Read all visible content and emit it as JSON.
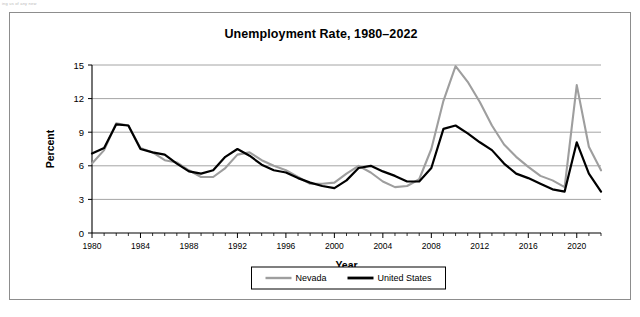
{
  "page": {
    "scan_fragment": "ing us of any new"
  },
  "figure": {
    "title": "Unemployment Rate, 1980–2022"
  },
  "chart_data": {
    "type": "line",
    "title": "Unemployment Rate, 1980–2022",
    "xlabel": "Year",
    "ylabel": "Percent",
    "xlim": [
      1980,
      2022
    ],
    "ylim": [
      0,
      15
    ],
    "yticks": [
      0,
      3,
      6,
      9,
      12,
      15
    ],
    "xticks": [
      1980,
      1984,
      1988,
      1992,
      1996,
      2000,
      2004,
      2008,
      2012,
      2016,
      2020
    ],
    "xtick_minor_step": 1,
    "grid": "horizontal",
    "legend_position": "bottom-center",
    "x": [
      1980,
      1981,
      1982,
      1983,
      1984,
      1985,
      1986,
      1987,
      1988,
      1989,
      1990,
      1991,
      1992,
      1993,
      1994,
      1995,
      1996,
      1997,
      1998,
      1999,
      2000,
      2001,
      2002,
      2003,
      2004,
      2005,
      2006,
      2007,
      2008,
      2009,
      2010,
      2011,
      2012,
      2013,
      2014,
      2015,
      2016,
      2017,
      2018,
      2019,
      2020,
      2021,
      2022
    ],
    "series": [
      {
        "name": "Nevada",
        "color": "#9e9e9e",
        "values": [
          6.2,
          7.4,
          9.8,
          9.6,
          7.6,
          7.2,
          6.5,
          6.3,
          5.6,
          5.0,
          5.0,
          5.8,
          7.0,
          7.2,
          6.5,
          6.0,
          5.6,
          5.0,
          4.4,
          4.4,
          4.5,
          5.3,
          6.0,
          5.4,
          4.6,
          4.1,
          4.2,
          4.8,
          7.5,
          11.8,
          14.9,
          13.5,
          11.7,
          9.6,
          7.9,
          6.8,
          5.9,
          5.1,
          4.7,
          4.1,
          13.2,
          7.7,
          5.6
        ]
      },
      {
        "name": "United States",
        "color": "#000000",
        "values": [
          7.1,
          7.6,
          9.7,
          9.6,
          7.5,
          7.2,
          7.0,
          6.2,
          5.5,
          5.3,
          5.6,
          6.8,
          7.5,
          6.9,
          6.1,
          5.6,
          5.4,
          4.9,
          4.5,
          4.2,
          4.0,
          4.7,
          5.8,
          6.0,
          5.5,
          5.1,
          4.6,
          4.6,
          5.8,
          9.3,
          9.6,
          8.9,
          8.1,
          7.4,
          6.2,
          5.3,
          4.9,
          4.4,
          3.9,
          3.7,
          8.1,
          5.3,
          3.7
        ]
      }
    ]
  },
  "legend": {
    "items": [
      {
        "label": "Nevada"
      },
      {
        "label": "United States"
      }
    ]
  }
}
